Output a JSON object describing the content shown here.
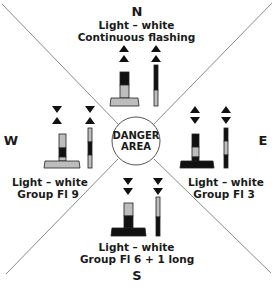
{
  "diagram": {
    "center": {
      "line1": "DANGER",
      "line2": "AREA"
    },
    "colors": {
      "line": "#8a8a8a",
      "black": "#111111",
      "grey": "#bdbdbd",
      "outline": "#222222"
    },
    "marks": [
      {
        "direction": "N",
        "light": "Light – white",
        "pattern": "Continuous flashing",
        "topmark": "two cones pointing up",
        "colors_top_to_bottom": [
          "black",
          "grey"
        ]
      },
      {
        "direction": "E",
        "light": "Light – white",
        "pattern": "Group Fl 3",
        "topmark": "two cones base to base",
        "colors_top_to_bottom": [
          "black",
          "grey",
          "black"
        ]
      },
      {
        "direction": "S",
        "light": "Light – white",
        "pattern": "Group Fl 6 + 1 long",
        "topmark": "two cones pointing down",
        "colors_top_to_bottom": [
          "grey",
          "black"
        ]
      },
      {
        "direction": "W",
        "light": "Light – white",
        "pattern": "Group Fl 9",
        "topmark": "two cones point to point",
        "colors_top_to_bottom": [
          "grey",
          "black",
          "grey"
        ]
      }
    ]
  }
}
